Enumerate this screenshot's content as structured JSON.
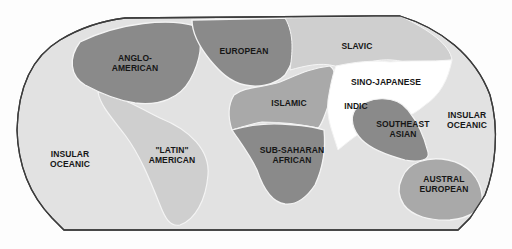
{
  "map": {
    "title": "World Culture Realms",
    "colors": {
      "ocean": "#e2e2e2",
      "outline": "#3c3c3c",
      "light_region": "#cfcfcf",
      "medium_region": "#a9a9a9",
      "dark_region": "#8a8a8a",
      "white_region": "#ffffff",
      "boundary": "#f4f4f4"
    },
    "regions": [
      {
        "id": "anglo-american",
        "line1": "ANGLO-",
        "line2": "AMERICAN",
        "shade": "dark"
      },
      {
        "id": "european",
        "line1": "EUROPEAN",
        "line2": "",
        "shade": "dark"
      },
      {
        "id": "slavic",
        "line1": "SLAVIC",
        "line2": "",
        "shade": "light"
      },
      {
        "id": "sino-japanese",
        "line1": "SINO-JAPANESE",
        "line2": "",
        "shade": "white"
      },
      {
        "id": "indic",
        "line1": "INDIC",
        "line2": "",
        "shade": "white"
      },
      {
        "id": "islamic",
        "line1": "ISLAMIC",
        "line2": "",
        "shade": "medium"
      },
      {
        "id": "sub-saharan-african",
        "line1": "SUB-SAHARAN",
        "line2": "AFRICAN",
        "shade": "dark"
      },
      {
        "id": "latin-american",
        "line1": "\"LATIN\"",
        "line2": "AMERICAN",
        "shade": "light"
      },
      {
        "id": "southeast-asian",
        "line1": "SOUTHEAST",
        "line2": "ASIAN",
        "shade": "dark"
      },
      {
        "id": "insular-oceanic-west",
        "line1": "INSULAR",
        "line2": "OCEANIC",
        "shade": "ocean"
      },
      {
        "id": "insular-oceanic-east",
        "line1": "INSULAR",
        "line2": "OCEANIC",
        "shade": "ocean"
      },
      {
        "id": "austral-european",
        "line1": "AUSTRAL",
        "line2": "EUROPEAN",
        "shade": "medium"
      }
    ]
  }
}
